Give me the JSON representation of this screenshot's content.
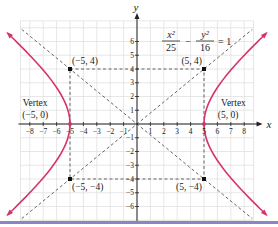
{
  "chart_data": {
    "type": "line",
    "equation": {
      "x_num": "x²",
      "x_den": "25",
      "minus": "−",
      "y_num": "y²",
      "y_den": "16",
      "rhs": "= 1"
    },
    "xlabel": "x",
    "ylabel": "y",
    "xlim": [
      -8.7,
      8.7
    ],
    "ylim": [
      -7,
      7.5
    ],
    "grid": true,
    "x_ticks": [
      -8,
      -7,
      -6,
      -5,
      -4,
      -3,
      -2,
      -1,
      1,
      2,
      3,
      4,
      5,
      6,
      7,
      8
    ],
    "x_tick_labels": [
      "−8",
      "−7",
      "−6",
      "−5",
      "−4",
      "−3",
      "−2",
      "−1",
      "1",
      "2",
      "3",
      "4",
      "5",
      "6",
      "7",
      "8"
    ],
    "y_ticks": [
      6,
      5,
      4,
      3,
      2,
      1,
      -1,
      -2,
      -3,
      -4,
      -5,
      -6
    ],
    "y_tick_labels": [
      "6",
      "5",
      "4",
      "3",
      "2",
      "1",
      "−1",
      "−2",
      "−3",
      "−4",
      "−5",
      "−6"
    ],
    "series": [
      {
        "name": "hyperbola-right-branch",
        "a": 5,
        "b": 4,
        "color": "#d6336c"
      },
      {
        "name": "hyperbola-left-branch",
        "a": 5,
        "b": 4,
        "color": "#d6336c"
      },
      {
        "name": "asymptote-positive",
        "slope": 0.8,
        "style": "dashed",
        "color": "#555555"
      },
      {
        "name": "asymptote-negative",
        "slope": -0.8,
        "style": "dashed",
        "color": "#555555"
      }
    ],
    "points": [
      {
        "x": -5,
        "y": 4,
        "label": "(−5, 4)"
      },
      {
        "x": 5,
        "y": 4,
        "label": "(5, 4)"
      },
      {
        "x": -5,
        "y": -4,
        "label": "(−5, −4)"
      },
      {
        "x": 5,
        "y": -4,
        "label": "(5, −4)"
      },
      {
        "x": -5,
        "y": 0,
        "label": "(−5, 0)"
      },
      {
        "x": 5,
        "y": 0,
        "label": "(5, 0)"
      }
    ],
    "annotations": [
      {
        "text": "Vertex",
        "sub": "(−5, 0)",
        "x": -5,
        "y": 0
      },
      {
        "text": "Vertex",
        "sub": "(5, 0)",
        "x": 5,
        "y": 0
      }
    ],
    "colors": {
      "curve": "#d6336c",
      "grid": "#dddddd",
      "axis": "#222222",
      "dashed": "#555555",
      "rule": "#8a86c4"
    }
  }
}
